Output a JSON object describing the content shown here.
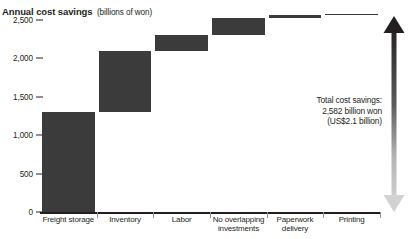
{
  "chart_data": {
    "type": "bar",
    "chart_subtype": "waterfall",
    "title": "Annual cost savings",
    "subtitle": "(billions of won)",
    "xlabel": "",
    "ylabel": "",
    "ylim": [
      0,
      2582
    ],
    "yticks": [
      0,
      500,
      1000,
      1500,
      2000,
      2500
    ],
    "ytick_labels": [
      "0",
      "500",
      "1,000",
      "1,500",
      "2,000",
      "2,500"
    ],
    "grid": false,
    "legend": "none",
    "categories": [
      "Freight storage",
      "Inventory",
      "Labor",
      "No overlapping investments",
      "Paperwork delivery",
      "Printing"
    ],
    "values": [
      1300,
      800,
      200,
      230,
      40,
      12
    ],
    "cumulative_start": [
      0,
      1300,
      2100,
      2300,
      2530,
      2570
    ],
    "cumulative_end": [
      1300,
      2100,
      2300,
      2530,
      2570,
      2582
    ],
    "bar_color": "#3b3b3b",
    "annotations": [
      "Total cost savings:",
      "2,582 billion won",
      "(US$2.1 billion)"
    ],
    "total": 2582,
    "total_label": "2,582 billion won",
    "total_usd": "(US$2.1 billion)"
  },
  "source": {
    "note": ""
  }
}
